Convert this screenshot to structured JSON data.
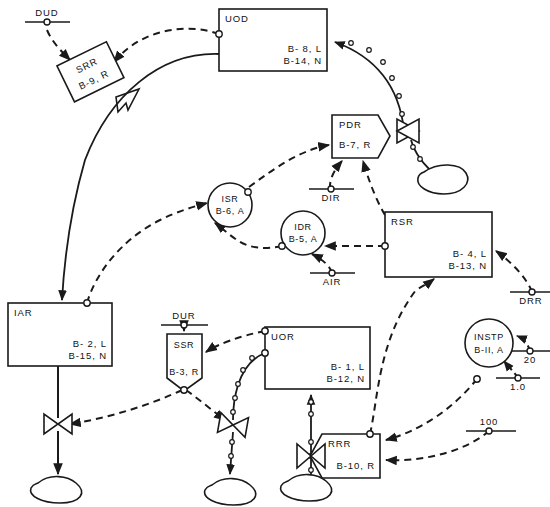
{
  "diagram": {
    "stroke_color": "#1a1a1a",
    "background_color": "#ffffff"
  },
  "blocks": [
    {
      "id": "uod",
      "shape": "rectangle",
      "name": "UOD",
      "tag1": "B- 8, L",
      "tag2": "B-14, N",
      "x": 219,
      "y": 9,
      "w": 108,
      "h": 62
    },
    {
      "id": "iar",
      "shape": "rectangle",
      "name": "IAR",
      "tag1": "B- 2, L",
      "tag2": "B-15, N",
      "x": 8,
      "y": 303,
      "w": 104,
      "h": 63
    },
    {
      "id": "uor",
      "shape": "rectangle",
      "name": "UOR",
      "tag1": "B- 1, L",
      "tag2": "B-12, N",
      "x": 265,
      "y": 327,
      "w": 105,
      "h": 62
    },
    {
      "id": "rsr",
      "shape": "rectangle",
      "name": "RSR",
      "tag1": "B- 4, L",
      "tag2": "B-13, N",
      "x": 385,
      "y": 212,
      "w": 107,
      "h": 65
    },
    {
      "id": "pdr",
      "shape": "pentagon-right",
      "name": "PDR",
      "tag1": "B-7, R",
      "tag2": "",
      "x": 332,
      "y": 115,
      "w": 58,
      "h": 43
    },
    {
      "id": "rrr",
      "shape": "pentagon-left",
      "name": "RRR",
      "tag1": "B-10, R",
      "tag2": "",
      "x": 322,
      "y": 434,
      "w": 58,
      "h": 44
    },
    {
      "id": "ssr",
      "shape": "pentagon-down",
      "name": "SSR",
      "tag1": "B-3, R",
      "tag2": "",
      "x": 167,
      "y": 334,
      "w": 35,
      "h": 54
    },
    {
      "id": "srr",
      "shape": "rotated-rect",
      "name": "SRR",
      "tag1": "B-9, R",
      "tag2": "",
      "x": 63,
      "y": 52,
      "w": 55,
      "h": 40
    },
    {
      "id": "isr",
      "shape": "circle",
      "name": "ISR",
      "tag1": "B-6, A",
      "tag2": "",
      "x": 210,
      "y": 185,
      "w": 40,
      "h": 40
    },
    {
      "id": "idr",
      "shape": "circle",
      "name": "IDR",
      "tag1": "B-5, A",
      "tag2": "",
      "x": 283,
      "y": 230,
      "w": 38,
      "h": 38
    },
    {
      "id": "instp",
      "shape": "circle",
      "name": "INSTP",
      "tag1": "B-II, A",
      "tag2": "",
      "x": 478,
      "y": 340,
      "w": 44,
      "h": 44
    }
  ],
  "sources": [
    {
      "id": "dud",
      "label": "DUD",
      "x": 47,
      "y": 22,
      "label_pos": "above"
    },
    {
      "id": "dir",
      "label": "DIR",
      "x": 331,
      "y": 197,
      "label_pos": "below"
    },
    {
      "id": "air",
      "label": "AIR",
      "x": 332,
      "y": 281,
      "label_pos": "below"
    },
    {
      "id": "drr",
      "label": "DRR",
      "x": 532,
      "y": 284,
      "label_pos": "below"
    },
    {
      "id": "dur",
      "label": "DUR",
      "x": 184,
      "y": 317,
      "label_pos": "above"
    },
    {
      "id": "const20",
      "label": "20",
      "x": 530,
      "y": 358,
      "label_pos": "below"
    },
    {
      "id": "const10",
      "label": "1.0",
      "x": 518,
      "y": 385,
      "label_pos": "below"
    },
    {
      "id": "const100",
      "label": "100",
      "x": 489,
      "y": 423,
      "label_pos": "above"
    }
  ],
  "valves": [
    {
      "id": "valve-pdr",
      "x": 408,
      "y": 131,
      "rotation": 0
    },
    {
      "id": "valve-iar",
      "x": 54,
      "y": 424,
      "rotation": 0
    },
    {
      "id": "valve-ssr",
      "x": 232,
      "y": 425,
      "rotation": 12
    },
    {
      "id": "valve-rrr",
      "x": 311,
      "y": 428,
      "rotation": 0
    }
  ],
  "vessels": [
    {
      "id": "vessel-pdr",
      "x": 432,
      "y": 173
    },
    {
      "id": "vessel-iar",
      "x": 55,
      "y": 483
    },
    {
      "id": "vessel-ssr",
      "x": 228,
      "y": 485
    },
    {
      "id": "vessel-rrr",
      "x": 305,
      "y": 481
    }
  ],
  "legend_notes": {
    "dashed_meaning": "signal line",
    "solid_meaning": "process line",
    "beaded_meaning": "pneumatic line"
  }
}
